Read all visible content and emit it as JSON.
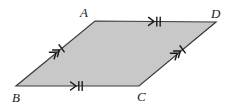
{
  "figure": {
    "kind": "parallelogram-diagram",
    "background_color": "#ffffff",
    "fill_color": "#c8c8c8",
    "stroke_color": "#3a3a3a",
    "mark_color": "#1a1a1a",
    "stroke_width": 1.2
  },
  "vertices": [
    {
      "id": "A",
      "label": "A",
      "x": 95,
      "y": 21,
      "label_x": 88,
      "label_y": 17,
      "anchor": "end"
    },
    {
      "id": "D",
      "label": "D",
      "x": 216,
      "y": 22,
      "label_x": 211,
      "label_y": 18,
      "anchor": "start"
    },
    {
      "id": "C",
      "label": "C",
      "x": 139,
      "y": 86,
      "label_x": 137,
      "label_y": 101,
      "anchor": "start"
    },
    {
      "id": "B",
      "label": "B",
      "x": 16,
      "y": 86,
      "label_x": 12,
      "label_y": 102,
      "anchor": "start"
    }
  ],
  "shape": {
    "name": "parallelogram-ABDC",
    "points": "95,21 216,22 139,86 16,86"
  },
  "edges": [
    {
      "id": "AD",
      "name": "edge-top-ad",
      "from": "A",
      "to": "D",
      "mid_x": 156,
      "mid_y": 21.5,
      "angle_deg": 0.5,
      "arrow_count": 1,
      "tick_count": 2,
      "marks_label": "1 arrow, 2 ticks"
    },
    {
      "id": "BC",
      "name": "edge-bottom-bc",
      "from": "B",
      "to": "C",
      "mid_x": 78,
      "mid_y": 86,
      "angle_deg": 0,
      "arrow_count": 1,
      "tick_count": 2,
      "marks_label": "1 arrow, 2 ticks"
    },
    {
      "id": "BA",
      "name": "edge-left-ba",
      "from": "B",
      "to": "A",
      "mid_x": 58,
      "mid_y": 51,
      "angle_deg": -36.5,
      "arrow_count": 2,
      "tick_count": 1,
      "marks_label": "2 arrows, 1 tick"
    },
    {
      "id": "CD",
      "name": "edge-right-cd",
      "from": "C",
      "to": "D",
      "mid_x": 179,
      "mid_y": 52,
      "angle_deg": -36.5,
      "arrow_count": 2,
      "tick_count": 1,
      "marks_label": "2 arrows, 1 tick"
    }
  ]
}
